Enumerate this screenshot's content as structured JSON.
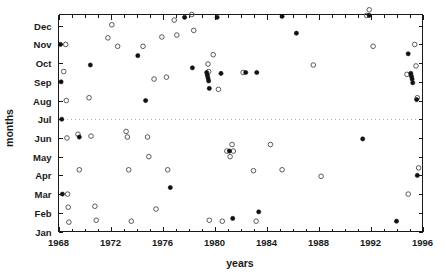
{
  "chart_data": {
    "type": "scatter",
    "title": "",
    "xlabel": "years",
    "ylabel": "months",
    "xlim": [
      1968,
      1996
    ],
    "ylim": [
      1,
      12.6
    ],
    "grid": false,
    "legend": null,
    "x_ticks": [
      1968,
      1972,
      1976,
      1980,
      1984,
      1988,
      1992,
      1996
    ],
    "x_tick_labels": [
      "1968",
      "1972",
      "1976",
      "1980",
      "1984",
      "1988",
      "1992",
      "1996"
    ],
    "x_minor_tick_step": 1,
    "y_ticks": [
      1,
      2,
      3,
      4,
      5,
      6,
      7,
      8,
      9,
      10,
      11,
      12
    ],
    "y_tick_labels": [
      "Jan",
      "Feb",
      "Mar",
      "Apr",
      "May",
      "Jun",
      "Jul",
      "Aug",
      "Sep",
      "Oct",
      "Nov",
      "Dec"
    ],
    "annotations": [
      {
        "kind": "horizontal-reference-line",
        "y": 7,
        "y_label": "Jul",
        "style": "dotted"
      }
    ],
    "series": [
      {
        "name": "open-circle",
        "marker": "open circle",
        "color": "#4a4a4a",
        "points": [
          [
            1968.55,
            11.0
          ],
          [
            1968.6,
            8.0
          ],
          [
            1968.65,
            6.0
          ],
          [
            1968.7,
            3.0
          ],
          [
            1968.75,
            2.3
          ],
          [
            1968.8,
            1.5
          ],
          [
            1968.4,
            9.55
          ],
          [
            1969.5,
            6.2
          ],
          [
            1969.6,
            4.3
          ],
          [
            1970.35,
            8.15
          ],
          [
            1970.5,
            6.1
          ],
          [
            1970.8,
            2.35
          ],
          [
            1970.9,
            1.6
          ],
          [
            1971.8,
            11.35
          ],
          [
            1972.1,
            12.05
          ],
          [
            1972.55,
            10.9
          ],
          [
            1973.2,
            6.35
          ],
          [
            1973.3,
            6.05
          ],
          [
            1973.4,
            4.3
          ],
          [
            1973.6,
            1.55
          ],
          [
            1974.5,
            10.9
          ],
          [
            1974.85,
            6.05
          ],
          [
            1974.95,
            5.0
          ],
          [
            1975.35,
            9.15
          ],
          [
            1975.5,
            2.2
          ],
          [
            1975.95,
            11.4
          ],
          [
            1976.3,
            9.25
          ],
          [
            1976.4,
            4.3
          ],
          [
            1976.9,
            12.3
          ],
          [
            1977.1,
            11.5
          ],
          [
            1978.25,
            12.6
          ],
          [
            1978.4,
            11.75
          ],
          [
            1979.5,
            9.95
          ],
          [
            1979.55,
            9.55
          ],
          [
            1979.6,
            1.6
          ],
          [
            1979.9,
            10.45
          ],
          [
            1980.3,
            8.6
          ],
          [
            1980.6,
            1.55
          ],
          [
            1980.95,
            5.3
          ],
          [
            1981.2,
            5.0
          ],
          [
            1981.35,
            5.65
          ],
          [
            1981.45,
            5.3
          ],
          [
            1982.2,
            9.5
          ],
          [
            1983.0,
            4.25
          ],
          [
            1983.2,
            1.55
          ],
          [
            1984.3,
            5.65
          ],
          [
            1985.2,
            4.3
          ],
          [
            1987.6,
            9.9
          ],
          [
            1988.2,
            3.95
          ],
          [
            1991.7,
            12.55
          ],
          [
            1991.9,
            12.85
          ],
          [
            1992.2,
            10.9
          ],
          [
            1994.8,
            9.4
          ],
          [
            1994.9,
            3.0
          ],
          [
            1995.4,
            11.0
          ],
          [
            1995.5,
            9.85
          ],
          [
            1995.6,
            8.15
          ],
          [
            1995.7,
            4.4
          ]
        ]
      },
      {
        "name": "filled-circle",
        "marker": "filled circle",
        "color": "#111111",
        "points": [
          [
            1968.15,
            11.0
          ],
          [
            1968.2,
            9.0
          ],
          [
            1968.25,
            7.0
          ],
          [
            1968.3,
            3.0
          ],
          [
            1969.6,
            6.05
          ],
          [
            1970.45,
            9.9
          ],
          [
            1974.1,
            10.4
          ],
          [
            1974.7,
            8.0
          ],
          [
            1976.6,
            3.35
          ],
          [
            1977.7,
            12.45
          ],
          [
            1978.3,
            9.75
          ],
          [
            1979.4,
            9.5
          ],
          [
            1979.45,
            9.35
          ],
          [
            1979.5,
            9.2
          ],
          [
            1979.55,
            9.05
          ],
          [
            1979.6,
            8.65
          ],
          [
            1980.2,
            12.45
          ],
          [
            1980.5,
            9.45
          ],
          [
            1981.15,
            5.3
          ],
          [
            1981.4,
            1.7
          ],
          [
            1982.4,
            9.5
          ],
          [
            1983.25,
            9.5
          ],
          [
            1983.4,
            2.05
          ],
          [
            1985.2,
            12.5
          ],
          [
            1986.3,
            11.6
          ],
          [
            1991.4,
            5.95
          ],
          [
            1991.9,
            12.55
          ],
          [
            1994.0,
            1.55
          ],
          [
            1994.9,
            10.5
          ],
          [
            1995.1,
            9.45
          ],
          [
            1995.15,
            9.3
          ],
          [
            1995.2,
            9.15
          ],
          [
            1995.25,
            8.95
          ],
          [
            1995.55,
            8.05
          ],
          [
            1995.6,
            4.0
          ]
        ]
      }
    ]
  },
  "colors": {
    "axis": "#1a1a1a",
    "open_marker": "#4a4a4a",
    "filled_marker": "#111111",
    "reference_line": "#9a9a9a",
    "background": "#ffffff"
  }
}
